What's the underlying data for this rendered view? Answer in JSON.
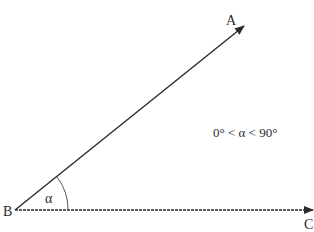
{
  "diagram": {
    "type": "angle",
    "vertex": {
      "label": "B",
      "x": 15,
      "y": 210
    },
    "rays": [
      {
        "label": "A",
        "tip_x": 244,
        "tip_y": 26
      },
      {
        "label": "C",
        "tip_x": 313,
        "tip_y": 210
      }
    ],
    "angle": {
      "symbol": "α",
      "arc_radius": 53
    },
    "condition": "0° < α < 90°",
    "colors": {
      "line": "#2a2a2a",
      "background": "#ffffff"
    }
  }
}
